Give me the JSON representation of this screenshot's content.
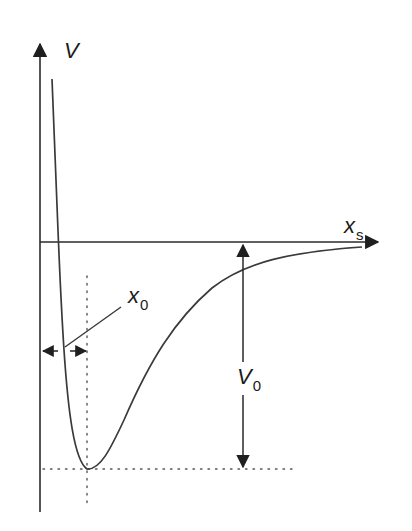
{
  "labels": {
    "y_axis": {
      "main": "V",
      "sub": ""
    },
    "x_axis": {
      "main": "x",
      "sub": "s"
    },
    "equilibrium_separation": {
      "main": "x",
      "sub": "0"
    },
    "well_depth": {
      "main": "V",
      "sub": "0"
    }
  },
  "colors": {
    "line": "#3a3a3a",
    "axis": "#2a2a2a",
    "dotted": "#555555",
    "background": "#ffffff"
  },
  "annotations": {
    "x0_meaning": "separation at potential minimum (double arrow between V axis and dotted vertical line)",
    "V0_meaning": "depth of potential well (double arrow from x-axis down to dotted minimum line)"
  }
}
